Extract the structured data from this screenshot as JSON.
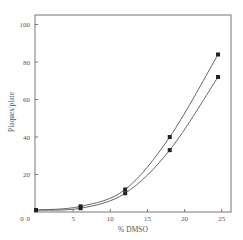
{
  "chart_data": {
    "type": "line",
    "title": "",
    "xlabel": "% DMSO",
    "ylabel": "Plaques/plate",
    "xlim": [
      0,
      26
    ],
    "ylim": [
      0,
      105
    ],
    "x_ticks": [
      0,
      5,
      10,
      15,
      20,
      25
    ],
    "y_ticks": [
      0,
      20,
      40,
      60,
      80,
      100
    ],
    "grid": false,
    "legend": null,
    "series": [
      {
        "name": "upper curve",
        "marker": "square",
        "x": [
          0,
          6,
          12,
          18,
          24.5
        ],
        "y": [
          1,
          3,
          12,
          40,
          84
        ]
      },
      {
        "name": "lower curve",
        "marker": "square",
        "x": [
          0,
          6,
          12,
          18,
          24.5
        ],
        "y": [
          1,
          2,
          10,
          33,
          72
        ]
      }
    ]
  },
  "labels": {
    "xlabel": "% DMSO",
    "ylabel": "Plaques/plate",
    "x_ticks": [
      "0",
      "5",
      "10",
      "15",
      "20",
      "25"
    ],
    "y_ticks": [
      "0",
      "20",
      "40",
      "60",
      "80",
      "100"
    ]
  }
}
